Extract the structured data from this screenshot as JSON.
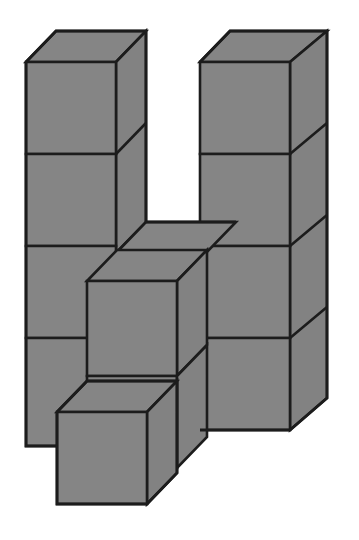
{
  "figure": {
    "background_color": "#ffffff",
    "canvas": {
      "width": 359,
      "height": 540
    }
  },
  "style": {
    "top_face_color": "#858585",
    "front_face_color": "#858585",
    "side_face_color": "#828282",
    "edge_color": "#1c1c1c",
    "edge_width": 2.6,
    "outline_width": 2.8
  },
  "projection": {
    "type": "cabinet-isometric",
    "cube_width": 90,
    "cube_height": 92,
    "depth_dx": 30,
    "depth_dy": -31
  },
  "cubes": [
    {
      "name": "left-column-cube-top",
      "column": "left",
      "level": 4,
      "front": [
        26,
        62,
        116,
        154
      ]
    },
    {
      "name": "left-column-cube-2",
      "column": "left",
      "level": 3,
      "front": [
        26,
        154,
        116,
        246
      ]
    },
    {
      "name": "left-column-cube-3",
      "column": "left",
      "level": 2,
      "front": [
        26,
        246,
        116,
        338
      ]
    },
    {
      "name": "left-column-cube-4",
      "column": "left",
      "level": 1,
      "front": [
        26,
        338,
        116,
        446
      ]
    },
    {
      "name": "right-column-cube-top",
      "column": "right",
      "level": 4,
      "front": [
        200,
        62,
        290,
        154
      ]
    },
    {
      "name": "right-column-cube-2",
      "column": "right",
      "level": 3,
      "front": [
        200,
        154,
        290,
        246
      ]
    },
    {
      "name": "right-column-cube-3",
      "column": "right",
      "level": 2,
      "front": [
        200,
        246,
        290,
        338
      ]
    },
    {
      "name": "right-column-cube-4",
      "column": "right",
      "level": 1,
      "front": [
        200,
        338,
        290,
        430
      ]
    },
    {
      "name": "middle-front-cube",
      "column": "middle",
      "level": 2,
      "front": [
        87,
        281,
        177,
        376
      ]
    },
    {
      "name": "bottom-front-cube",
      "column": "middle",
      "level": 1,
      "front": [
        57,
        412,
        147,
        504
      ]
    },
    {
      "name": "bridge-cube",
      "column": "middle",
      "level": 3,
      "front": [
        116,
        251,
        206,
        343
      ]
    }
  ],
  "counts": {
    "total_cubes_visible": 11,
    "left_column_cubes": 4,
    "right_column_cubes": 4,
    "protruding_cubes": 3
  }
}
